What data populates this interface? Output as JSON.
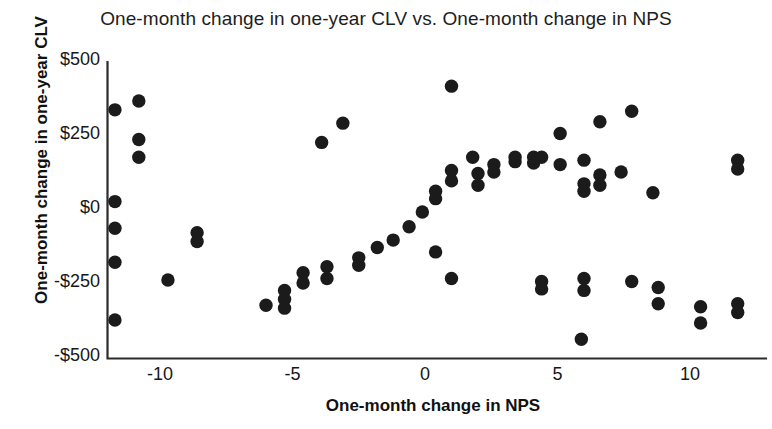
{
  "chart_data": {
    "type": "scatter",
    "title": "One-month change in one-year CLV vs. One-month change in NPS",
    "xlabel": "One-month change in NPS",
    "ylabel": "One-month change in one-year CLV",
    "xlim": [
      -12.2,
      12.4
    ],
    "ylim": [
      -500,
      500
    ],
    "xticks": [
      -10,
      -5,
      0,
      5,
      10
    ],
    "xtick_labels": [
      "-10",
      "-5",
      "0",
      "5",
      "10"
    ],
    "yticks": [
      -500,
      -250,
      0,
      250,
      500
    ],
    "ytick_labels": [
      "-$500",
      "-$250",
      "$0",
      "$250",
      "$500"
    ],
    "grid": false,
    "legend": null,
    "marker": {
      "shape": "circle",
      "color": "#1b1b1b",
      "size": 7
    },
    "points": [
      {
        "x": -11.7,
        "y": 335
      },
      {
        "x": -11.7,
        "y": 25
      },
      {
        "x": -11.7,
        "y": -65
      },
      {
        "x": -11.7,
        "y": -180
      },
      {
        "x": -11.7,
        "y": -375
      },
      {
        "x": -10.8,
        "y": 365
      },
      {
        "x": -10.8,
        "y": 235
      },
      {
        "x": -10.8,
        "y": 175
      },
      {
        "x": -9.7,
        "y": -240
      },
      {
        "x": -8.6,
        "y": -80
      },
      {
        "x": -8.6,
        "y": -110
      },
      {
        "x": -6.0,
        "y": -325
      },
      {
        "x": -5.3,
        "y": -275
      },
      {
        "x": -5.3,
        "y": -305
      },
      {
        "x": -5.3,
        "y": -335
      },
      {
        "x": -4.6,
        "y": -215
      },
      {
        "x": -4.6,
        "y": -250
      },
      {
        "x": -3.9,
        "y": 225
      },
      {
        "x": -3.7,
        "y": -195
      },
      {
        "x": -3.7,
        "y": -235
      },
      {
        "x": -3.1,
        "y": 290
      },
      {
        "x": -2.5,
        "y": -165
      },
      {
        "x": -2.5,
        "y": -190
      },
      {
        "x": -1.8,
        "y": -130
      },
      {
        "x": -1.2,
        "y": -105
      },
      {
        "x": -0.6,
        "y": -60
      },
      {
        "x": -0.1,
        "y": -10
      },
      {
        "x": 0.4,
        "y": 35
      },
      {
        "x": 0.4,
        "y": 60
      },
      {
        "x": 0.4,
        "y": -145
      },
      {
        "x": 1.0,
        "y": 415
      },
      {
        "x": 1.0,
        "y": 130
      },
      {
        "x": 1.0,
        "y": 95
      },
      {
        "x": 1.0,
        "y": -235
      },
      {
        "x": 1.8,
        "y": 175
      },
      {
        "x": 2.0,
        "y": 120
      },
      {
        "x": 2.0,
        "y": 80
      },
      {
        "x": 2.6,
        "y": 150
      },
      {
        "x": 2.6,
        "y": 125
      },
      {
        "x": 3.4,
        "y": 175
      },
      {
        "x": 3.4,
        "y": 160
      },
      {
        "x": 4.1,
        "y": 175
      },
      {
        "x": 4.1,
        "y": 155
      },
      {
        "x": 4.4,
        "y": 175
      },
      {
        "x": 4.4,
        "y": -245
      },
      {
        "x": 4.4,
        "y": -270
      },
      {
        "x": 5.1,
        "y": 255
      },
      {
        "x": 5.1,
        "y": 150
      },
      {
        "x": 5.9,
        "y": -440
      },
      {
        "x": 6.0,
        "y": 165
      },
      {
        "x": 6.0,
        "y": 85
      },
      {
        "x": 6.0,
        "y": 60
      },
      {
        "x": 6.0,
        "y": -235
      },
      {
        "x": 6.0,
        "y": -275
      },
      {
        "x": 6.6,
        "y": 295
      },
      {
        "x": 6.6,
        "y": 115
      },
      {
        "x": 6.6,
        "y": 80
      },
      {
        "x": 7.4,
        "y": 125
      },
      {
        "x": 7.8,
        "y": 330
      },
      {
        "x": 7.8,
        "y": -245
      },
      {
        "x": 8.6,
        "y": 55
      },
      {
        "x": 8.8,
        "y": -265
      },
      {
        "x": 8.8,
        "y": -320
      },
      {
        "x": 10.4,
        "y": -330
      },
      {
        "x": 10.4,
        "y": -385
      },
      {
        "x": 11.8,
        "y": 165
      },
      {
        "x": 11.8,
        "y": 135
      },
      {
        "x": 11.8,
        "y": -320
      },
      {
        "x": 11.8,
        "y": -350
      }
    ]
  },
  "axes": {
    "x_title": "One-month change in NPS",
    "y_title": "One-month change in one-year CLV"
  },
  "title": "One-month change in one-year CLV vs. One-month change in NPS"
}
